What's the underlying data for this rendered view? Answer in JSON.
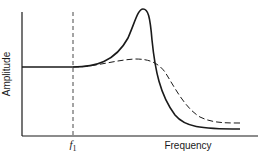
{
  "diagram": {
    "y_axis_label": "Amplitude",
    "x_axis_label": "Frequency",
    "marker": {
      "symbol": "f",
      "subscript": "1"
    },
    "colors": {
      "ink": "#1a1a1a",
      "background": "#ffffff"
    },
    "curves": [
      {
        "name": "resonant-response",
        "style": "solid",
        "description": "flat, then sharp resonance peak, then rapid fall-off"
      },
      {
        "name": "damped-response",
        "style": "dashed",
        "description": "flat, then gentle hump, then gradual fall-off"
      }
    ]
  }
}
